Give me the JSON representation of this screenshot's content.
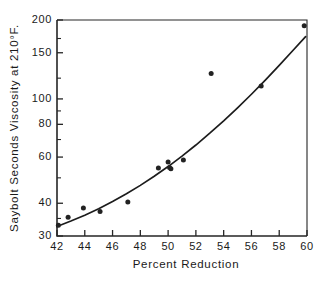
{
  "chart_data": {
    "type": "scatter",
    "title": "",
    "xlabel": "Percent  Reduction",
    "ylabel": "Saybolt Seconds Viscosity at 210°F.",
    "xlim": [
      42,
      60
    ],
    "ylim": [
      30,
      200
    ],
    "yscale": "log",
    "grid": false,
    "legend": null,
    "xticks": [
      42,
      44,
      46,
      48,
      50,
      52,
      54,
      56,
      58,
      60
    ],
    "xticklabels": [
      "42",
      "44",
      "46",
      "48",
      "50",
      "52",
      "54",
      "56",
      "58",
      "60"
    ],
    "yticks": [
      30,
      40,
      60,
      80,
      100,
      150,
      200
    ],
    "yticklabels": [
      "30",
      "40",
      "60",
      "80",
      "100",
      "150",
      "200"
    ],
    "yticks_minor": [
      35,
      50,
      70,
      90,
      120,
      170
    ],
    "points": [
      {
        "x": 42.1,
        "y": 33.0
      },
      {
        "x": 42.8,
        "y": 35.4
      },
      {
        "x": 43.9,
        "y": 38.4
      },
      {
        "x": 45.1,
        "y": 37.2
      },
      {
        "x": 47.1,
        "y": 40.4
      },
      {
        "x": 49.3,
        "y": 54.5
      },
      {
        "x": 50.0,
        "y": 57.5
      },
      {
        "x": 50.1,
        "y": 54.8
      },
      {
        "x": 50.2,
        "y": 54.2
      },
      {
        "x": 51.1,
        "y": 58.5
      },
      {
        "x": 53.1,
        "y": 125.0
      },
      {
        "x": 56.7,
        "y": 112.0
      },
      {
        "x": 59.8,
        "y": 190.0
      }
    ],
    "fit_curve": {
      "name": "fitted exponential curve",
      "x": [
        42.0,
        43.0,
        44.0,
        45.0,
        46.0,
        47.0,
        48.0,
        49.0,
        50.0,
        51.0,
        52.0,
        53.0,
        54.0,
        55.0,
        56.0,
        57.0,
        58.0,
        59.0,
        59.9
      ],
      "y": [
        32.6,
        34.2,
        36.0,
        38.1,
        40.6,
        43.5,
        46.8,
        50.7,
        55.2,
        60.5,
        66.7,
        74.0,
        82.5,
        92.5,
        104.2,
        118.0,
        134.2,
        153.3,
        172.8
      ]
    },
    "marker": "filled-circle",
    "marker_color": "#222222",
    "curve_color": "#1c1c1c"
  }
}
